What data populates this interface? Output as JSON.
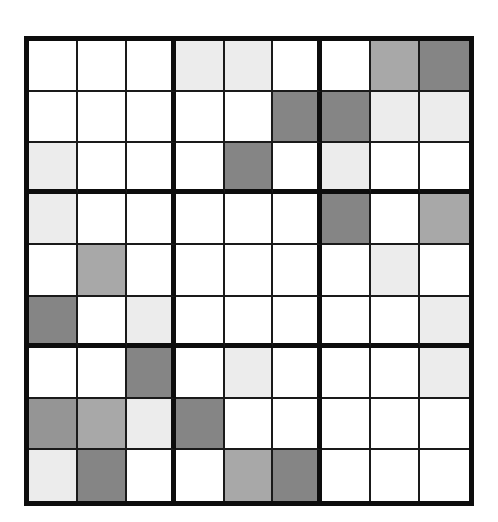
{
  "puzzle": {
    "type": "shaded-grid",
    "rows": 9,
    "cols": 9,
    "block_size": 3,
    "shade_colors": {
      "w": "#ffffff",
      "l": "#ececec",
      "m": "#a8a8a8",
      "md": "#959595",
      "d": "#858585"
    },
    "grid": [
      [
        "w",
        "w",
        "w",
        "l",
        "l",
        "w",
        "w",
        "m",
        "d"
      ],
      [
        "w",
        "w",
        "w",
        "w",
        "w",
        "d",
        "d",
        "l",
        "l"
      ],
      [
        "l",
        "w",
        "w",
        "w",
        "d",
        "w",
        "l",
        "w",
        "w"
      ],
      [
        "l",
        "w",
        "w",
        "w",
        "w",
        "w",
        "d",
        "w",
        "m"
      ],
      [
        "w",
        "m",
        "w",
        "w",
        "w",
        "w",
        "w",
        "l",
        "w"
      ],
      [
        "d",
        "w",
        "l",
        "w",
        "w",
        "w",
        "w",
        "w",
        "l"
      ],
      [
        "w",
        "w",
        "d",
        "w",
        "l",
        "w",
        "w",
        "w",
        "l"
      ],
      [
        "md",
        "m",
        "l",
        "d",
        "w",
        "w",
        "w",
        "w",
        "w"
      ],
      [
        "l",
        "d",
        "w",
        "w",
        "m",
        "d",
        "w",
        "w",
        "w"
      ]
    ]
  }
}
